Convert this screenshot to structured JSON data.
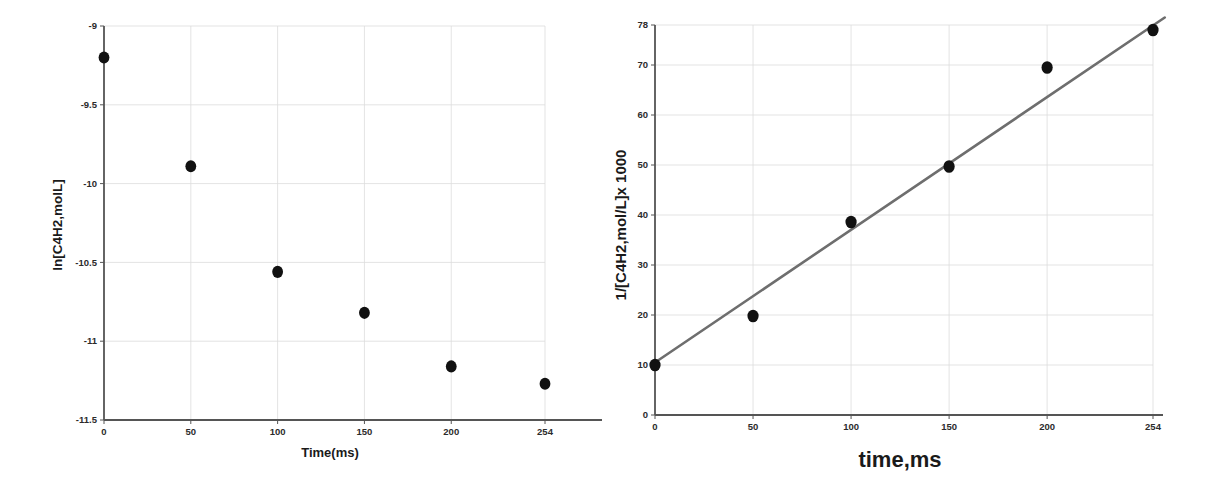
{
  "figure": {
    "background": "#ffffff",
    "marker_color": "#111111",
    "axis_color": "#555555",
    "grid_color": "#dcdcdc",
    "fit_line_color": "#6e6e6e"
  },
  "chart_data": [
    {
      "id": "first-order-plot",
      "type": "scatter",
      "title": "",
      "xlabel": "Time(ms)",
      "ylabel": "ln[C4H2,molL]",
      "xlim": [
        0,
        254
      ],
      "ylim": [
        -11.5,
        -9
      ],
      "xticks": [
        0,
        50,
        100,
        150,
        200,
        254
      ],
      "xtick_labels": [
        "0",
        "50",
        "100",
        "150",
        "200",
        "254"
      ],
      "yticks": [
        -11.5,
        -11,
        -10.5,
        -10,
        -9.5,
        -9
      ],
      "ytick_labels": [
        "-11.5",
        "-11",
        "-10.5",
        "-10",
        "-9.5",
        "-9"
      ],
      "grid": true,
      "legend": "none",
      "x": [
        0,
        50,
        100,
        150,
        200,
        254
      ],
      "y": [
        -9.2,
        -9.89,
        -10.56,
        -10.82,
        -11.16,
        -11.27
      ],
      "series": [
        {
          "name": "ln[C4H2]",
          "values": [
            -9.2,
            -9.89,
            -10.56,
            -10.82,
            -11.16,
            -11.27
          ]
        }
      ],
      "has_fit_line": false
    },
    {
      "id": "second-order-plot",
      "type": "scatter",
      "title": "",
      "xlabel": "time,ms",
      "ylabel": "1/[C4H2,mol/L]x 1000",
      "xlim": [
        0,
        254
      ],
      "ylim": [
        0,
        78
      ],
      "xticks": [
        0,
        50,
        100,
        150,
        200,
        254
      ],
      "xtick_labels": [
        "0",
        "50",
        "100",
        "150",
        "200",
        "254"
      ],
      "yticks": [
        0,
        10,
        20,
        30,
        40,
        50,
        60,
        70,
        78
      ],
      "ytick_labels": [
        "0",
        "10",
        "20",
        "30",
        "40",
        "50",
        "60",
        "70",
        "78"
      ],
      "grid": true,
      "legend": "none",
      "x": [
        0,
        50,
        100,
        150,
        200,
        254
      ],
      "y": [
        10.0,
        19.8,
        38.6,
        49.7,
        69.5,
        77.0
      ],
      "series": [
        {
          "name": "1/[C4H2] x 1000",
          "values": [
            10.0,
            19.8,
            38.6,
            49.7,
            69.5,
            77.0
          ]
        }
      ],
      "has_fit_line": true,
      "fit_line": {
        "x_start": 0,
        "y_start": 10.5,
        "x_end": 260,
        "y_end": 79.5
      }
    }
  ]
}
